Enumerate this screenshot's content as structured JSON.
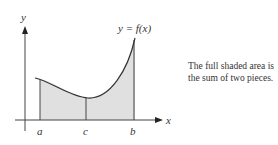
{
  "figure": {
    "y_axis_label": "y",
    "x_axis_label": "x",
    "curve_label": "y = f(x)",
    "tick_labels": [
      "a",
      "c",
      "b"
    ],
    "fill_color": "#e0e0e0",
    "stroke_color": "#333333"
  },
  "caption": {
    "line1": "The full shaded area is",
    "line2": "the sum of two pieces."
  }
}
